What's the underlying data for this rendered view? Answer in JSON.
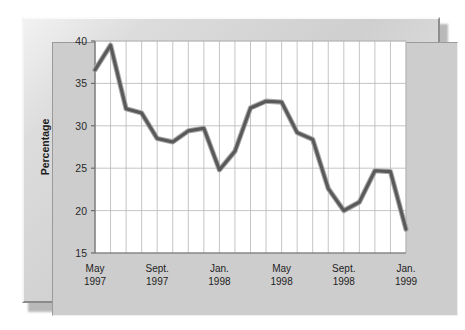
{
  "chart_data": {
    "type": "line",
    "title": "",
    "subtitle": "",
    "xlabel": "",
    "ylabel": "Percentage",
    "ylim": [
      15,
      40
    ],
    "yticks": [
      15,
      20,
      25,
      30,
      35,
      40
    ],
    "ytick_labels": [
      "15",
      "20",
      "25",
      "30",
      "35",
      "40"
    ],
    "grid": true,
    "grid_vertical": true,
    "grid_horizontal": true,
    "legend": false,
    "legend_position": "none",
    "markers": false,
    "line_color": "#595959",
    "line_highlight_color": "#a8a8a8",
    "plot_background": "#ffffff",
    "panel_background": "#cdcdcd",
    "x": [
      "May 1997",
      "Jun. 1997",
      "Jul. 1997",
      "Aug. 1997",
      "Sept. 1997",
      "Oct. 1997",
      "Nov. 1997",
      "Dec. 1997",
      "Jan. 1998",
      "Feb. 1998",
      "Mar. 1998",
      "Apr. 1998",
      "May 1998",
      "Jun. 1998",
      "Jul. 1998",
      "Aug. 1998",
      "Sept. 1998",
      "Oct. 1998",
      "Nov. 1998",
      "Dec. 1998",
      "Jan. 1999"
    ],
    "xtick_labels": [
      "May\n1997",
      "Sept.\n1997",
      "Jan.\n1998",
      "May\n1998",
      "Sept.\n1998",
      "Jan.\n1999"
    ],
    "xticks_major": [
      {
        "index": 0,
        "month": "May",
        "year": "1997"
      },
      {
        "index": 4,
        "month": "Sept.",
        "year": "1997"
      },
      {
        "index": 8,
        "month": "Jan.",
        "year": "1998"
      },
      {
        "index": 12,
        "month": "May",
        "year": "1998"
      },
      {
        "index": 16,
        "month": "Sept.",
        "year": "1998"
      },
      {
        "index": 20,
        "month": "Jan.",
        "year": "1999"
      }
    ],
    "values": [
      36.6,
      39.5,
      32.0,
      31.5,
      28.5,
      28.1,
      29.4,
      29.7,
      24.8,
      27.0,
      32.1,
      32.9,
      32.8,
      29.2,
      28.4,
      22.6,
      20.0,
      21.0,
      24.7,
      24.6,
      17.8
    ],
    "series": [
      {
        "name": "Percentage",
        "values": [
          36.6,
          39.5,
          32.0,
          31.5,
          28.5,
          28.1,
          29.4,
          29.7,
          24.8,
          27.0,
          32.1,
          32.9,
          32.8,
          29.2,
          28.4,
          22.6,
          20.0,
          21.0,
          24.7,
          24.6,
          17.8
        ]
      }
    ]
  }
}
